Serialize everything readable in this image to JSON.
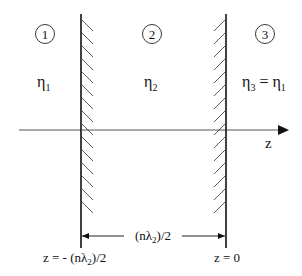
{
  "regions": [
    {
      "number": "1",
      "eta_base": "η",
      "eta_sub": "1",
      "eq_text": ""
    },
    {
      "number": "2",
      "eta_base": "η",
      "eta_sub": "2",
      "eq_text": ""
    },
    {
      "number": "3",
      "eta_base": "η",
      "eta_sub": "3",
      "eq_text": " = η",
      "eq_sub": "1"
    }
  ],
  "axis": {
    "label": "z"
  },
  "dimension": {
    "label_pre": "(nλ",
    "label_sub": "2",
    "label_post": ")/2"
  },
  "walls": {
    "left": {
      "label_pre": "z = - (nλ",
      "label_sub": "2",
      "label_post": ")/2"
    },
    "right": {
      "label": "z = 0"
    }
  },
  "colors": {
    "line": "#111111",
    "axis": "#555555",
    "background": "#ffffff"
  }
}
